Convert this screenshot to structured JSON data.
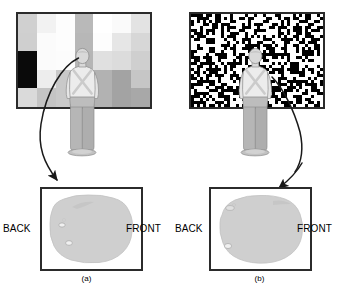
{
  "figure": {
    "panels": [
      {
        "id": "a",
        "caption": "(a)",
        "wall": {
          "name": "coarse-grayscale-checkerboard",
          "type": "coarse-blocks",
          "cols": 7,
          "rows": 5,
          "border_color": "#2b2b2b",
          "cells": [
            [
              "#d0d0d0",
              "#f2f2f2",
              "#fdfdfd",
              "#b9b9b9",
              "#ffffff",
              "#fafafa",
              "#e3e3e3"
            ],
            [
              "#cfcfcf",
              "#fbfbfb",
              "#fdfdfd",
              "#b7b7b7",
              "#fdfdfd",
              "#e6e6e6",
              "#d7d7d7"
            ],
            [
              "#0a0a0a",
              "#fbfbfb",
              "#fcfcfc",
              "#b5b5b5",
              "#e0e0e0",
              "#dcdcdc",
              "#cfcfcf"
            ],
            [
              "#0a0a0a",
              "#ededed",
              "#c9c9c9",
              "#c6c6c6",
              "#b2b2b2",
              "#a3a3a3",
              "#c6c6c6"
            ],
            [
              "#dadada",
              "#c4c4c4",
              "#c9c9c9",
              "#cfcfcf",
              "#b2b2b2",
              "#a3a3a3",
              "#a8a8a8"
            ]
          ]
        },
        "person": {
          "name": "person-viewed-from-behind",
          "shirt_color": "#ececec",
          "pants_color": "#b6b6b6",
          "skin_color": "#d9d9d9",
          "outline_color": "#8a8a8a"
        },
        "arrow": {
          "name": "callout-arrow",
          "from": "head",
          "to": "back-region-of-footprint",
          "color": "#1a1a1a"
        },
        "sole": {
          "name": "foot-pressure-footprint",
          "fill": "#cfcfcf",
          "outline": "#bcbcbc",
          "highlight_region": "back"
        },
        "labels": {
          "back": "BACK",
          "front": "FRONT"
        }
      },
      {
        "id": "b",
        "caption": "(b)",
        "wall": {
          "name": "fine-binary-random-noise",
          "type": "binary-noise",
          "cell_size": 3,
          "cols": 44,
          "rows": 31,
          "black": "#000000",
          "white": "#ffffff",
          "border_color": "#2b2b2b",
          "density": 0.5
        },
        "person": {
          "name": "person-viewed-from-behind",
          "shirt_color": "#ececec",
          "pants_color": "#b6b6b6",
          "skin_color": "#d9d9d9",
          "outline_color": "#8a8a8a"
        },
        "arrow": {
          "name": "callout-arrow",
          "from": "right-shoulder",
          "to": "front-region-of-footprint",
          "color": "#1a1a1a"
        },
        "sole": {
          "name": "foot-pressure-footprint",
          "fill": "#cfcfcf",
          "outline": "#bcbcbc",
          "highlight_region": "front"
        },
        "labels": {
          "back": "BACK",
          "front": "FRONT"
        }
      }
    ]
  }
}
